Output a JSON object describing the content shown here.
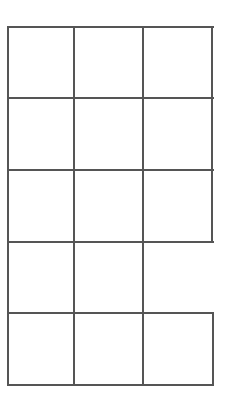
{
  "grid": {
    "rows": 5,
    "columns": 3,
    "line_color": "#555555",
    "background": "#ffffff",
    "col_edges": [
      7,
      74,
      143,
      212
    ],
    "row_edges": [
      27,
      98,
      170,
      242,
      313,
      385
    ],
    "open_segment": "right border of row 4, column 3 is missing"
  }
}
